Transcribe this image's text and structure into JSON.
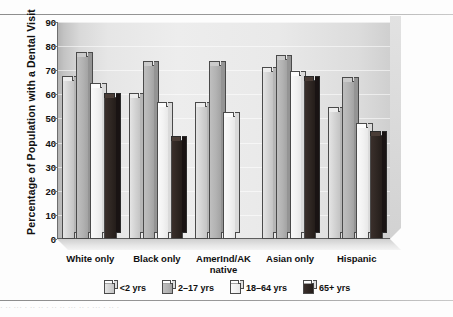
{
  "figure": {
    "ylabel": "Percentage of Population with a Dental Visit",
    "bottom_cutoff_text": "· ··  ··· ·   ·· ·· ·   ·· ·· ···  ·· ·  ··· · ·· ·"
  },
  "chart_data": {
    "type": "bar",
    "title": "",
    "xlabel": "",
    "ylabel": "Percentage of Population with a Dental Visit",
    "categories": [
      "White only",
      "Black only",
      "AmerInd/AK\nnative",
      "Asian only",
      "Hispanic"
    ],
    "ylim": [
      0,
      90
    ],
    "yticks": [
      0,
      10,
      20,
      30,
      40,
      50,
      60,
      70,
      80,
      90
    ],
    "grid": true,
    "legend_position": "bottom",
    "series": [
      {
        "name": "<2 yrs",
        "color": "#d2d2d2",
        "values": [
          66,
          59,
          55,
          69.5,
          53
        ]
      },
      {
        "name": "2–17 yrs",
        "color": "#b2b2b2",
        "values": [
          76,
          72,
          72,
          74.5,
          65.5
        ]
      },
      {
        "name": "18–64 yrs",
        "color": "#f2f2f2",
        "values": [
          63,
          55,
          51,
          68,
          46.5
        ]
      },
      {
        "name": "65+ yrs",
        "color": "#2e2622",
        "values": [
          59,
          41,
          null,
          66,
          43
        ]
      }
    ]
  }
}
